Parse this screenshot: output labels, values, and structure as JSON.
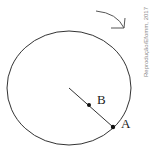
{
  "diagram": {
    "labels": {
      "point_a": "A",
      "point_b": "B"
    },
    "credit": "Reprodução/Efomm, 2017",
    "rotation_direction": "clockwise",
    "colors": {
      "stroke": "#333333",
      "background": "#ffffff",
      "credit": "#8a8a8a"
    }
  }
}
